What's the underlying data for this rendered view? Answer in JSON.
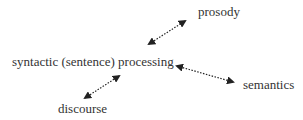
{
  "diagram": {
    "center": {
      "label": "syntactic (sentence) processing",
      "x": 12,
      "y": 66
    },
    "nodes": [
      {
        "id": "prosody",
        "label": "prosody",
        "x": 198,
        "y": 16
      },
      {
        "id": "semantics",
        "label": "semantics",
        "x": 243,
        "y": 89
      },
      {
        "id": "discourse",
        "label": "discourse",
        "x": 58,
        "y": 113
      }
    ],
    "edges": [
      {
        "to": "prosody",
        "style": "dotted",
        "arrows": "both"
      },
      {
        "to": "semantics",
        "style": "dotted",
        "arrows": "both"
      },
      {
        "to": "discourse",
        "style": "dotted",
        "arrows": "both"
      }
    ],
    "colors": {
      "text": "#333333",
      "arrow": "#222222"
    }
  }
}
